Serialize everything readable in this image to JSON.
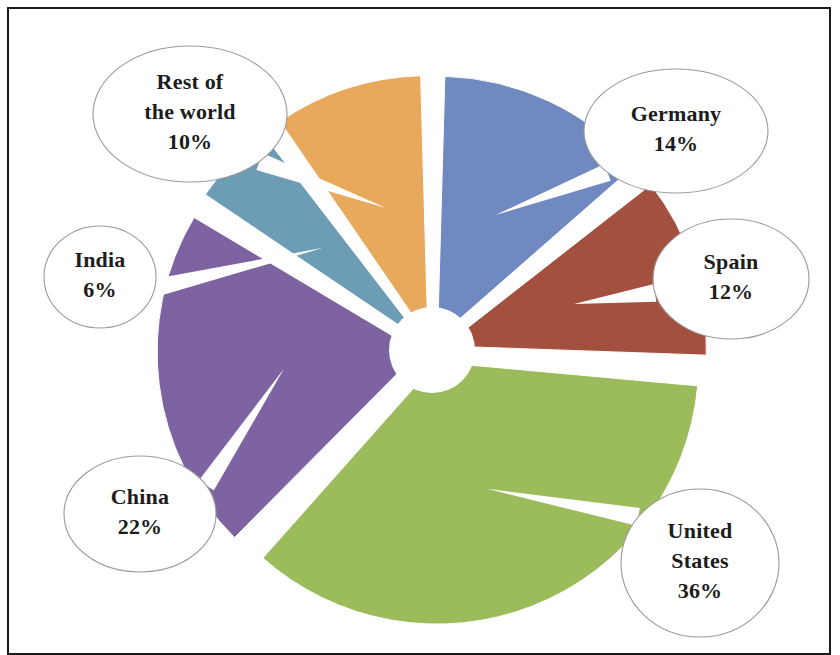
{
  "figure": {
    "background_color": "#ffffff",
    "frame_color": "#1b1b1b",
    "callout_fill": "#ffffff",
    "callout_stroke": "#9a9a9a",
    "text_color": "#1c1c1c"
  },
  "chart_data": {
    "type": "pie",
    "title": "",
    "subtitle": "",
    "xlabel": "",
    "ylabel": "",
    "grid": false,
    "legend_position": "none",
    "label_format": "name + percent",
    "exploded": true,
    "donut_hole": true,
    "start_angle_deg": 0,
    "direction": "clockwise",
    "units": "percent",
    "total": 100,
    "categories": [
      "Germany",
      "Spain",
      "United States",
      "China",
      "India",
      "Rest of the world"
    ],
    "values": [
      14,
      12,
      36,
      22,
      6,
      10
    ],
    "colors": [
      "#7089c0",
      "#a3503f",
      "#9cbc5c",
      "#7e63a3",
      "#6d9cb5",
      "#e9a95c"
    ],
    "slices": [
      {
        "name": "Germany",
        "value": 14,
        "percent_label": "14%",
        "color": "#7089c0",
        "label_lines": [
          "Germany",
          "14%"
        ],
        "callout": {
          "cx": 676,
          "cy": 131,
          "rx": 92,
          "ry": 62
        }
      },
      {
        "name": "Spain",
        "value": 12,
        "percent_label": "12%",
        "color": "#a3503f",
        "label_lines": [
          "Spain",
          "12%"
        ],
        "callout": {
          "cx": 731,
          "cy": 279,
          "rx": 78,
          "ry": 60
        }
      },
      {
        "name": "United States",
        "value": 36,
        "percent_label": "36%",
        "color": "#9cbc5c",
        "label_lines": [
          "United",
          "States",
          "36%"
        ],
        "callout": {
          "cx": 700,
          "cy": 563,
          "rx": 79,
          "ry": 74
        }
      },
      {
        "name": "China",
        "value": 22,
        "percent_label": "22%",
        "color": "#7e63a3",
        "label_lines": [
          "China",
          "22%"
        ],
        "callout": {
          "cx": 140,
          "cy": 514,
          "rx": 76,
          "ry": 58
        }
      },
      {
        "name": "India",
        "value": 6,
        "percent_label": "6%",
        "color": "#6d9cb5",
        "label_lines": [
          "India",
          "6%"
        ],
        "callout": {
          "cx": 100,
          "cy": 277,
          "rx": 56,
          "ry": 51
        }
      },
      {
        "name": "Rest of the world",
        "value": 10,
        "percent_label": "10%",
        "color": "#e9a95c",
        "label_lines": [
          "Rest of",
          "the world",
          "10%"
        ],
        "callout": {
          "cx": 190,
          "cy": 114,
          "rx": 97,
          "ry": 68
        }
      }
    ]
  },
  "geometry": {
    "center_x": 432,
    "center_y": 350,
    "radius": 262,
    "hub_radius": 43,
    "explode_offset": 13
  }
}
